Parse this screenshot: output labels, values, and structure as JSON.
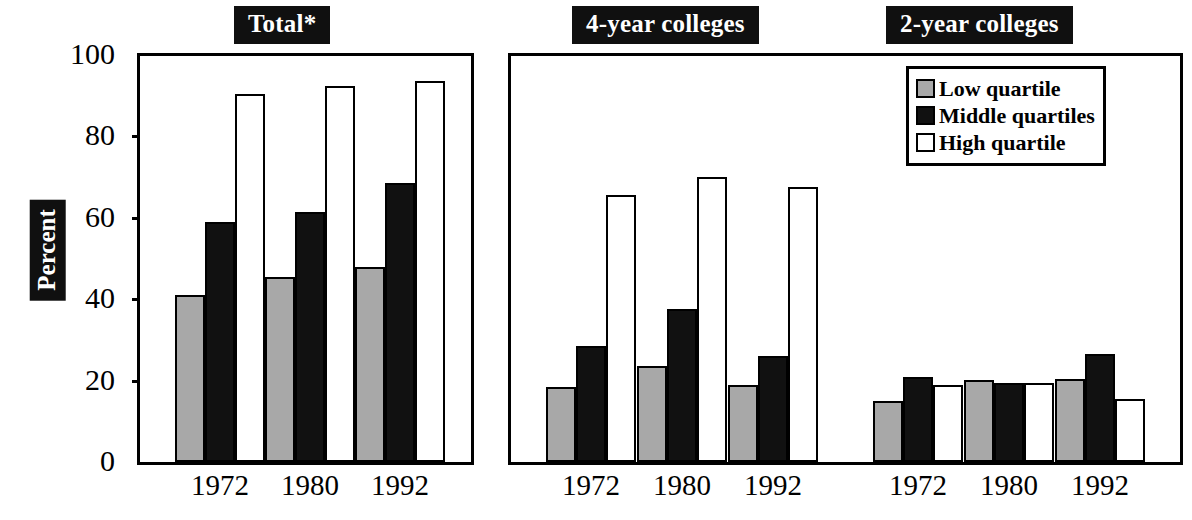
{
  "figure": {
    "ylabel": "Percent",
    "panels": [
      {
        "id": "total",
        "title": "Total*"
      },
      {
        "id": "four_year",
        "title": "4-year colleges"
      },
      {
        "id": "two_year",
        "title": "2-year colleges"
      }
    ]
  },
  "axis": {
    "ticks": [
      {
        "value": 100,
        "label": "100"
      },
      {
        "value": 80,
        "label": "80"
      },
      {
        "value": 60,
        "label": "60"
      },
      {
        "value": 40,
        "label": "40"
      },
      {
        "value": 20,
        "label": "20"
      },
      {
        "value": 0,
        "label": "0"
      }
    ],
    "ymin": 0,
    "ymax": 100
  },
  "legend": {
    "title": "",
    "entries": [
      {
        "label": "Low quartile",
        "color": "#a8a8a8",
        "key": "low"
      },
      {
        "label": "Middle quartiles",
        "color": "#111111",
        "key": "middle"
      },
      {
        "label": "High quartile",
        "color": "#ffffff",
        "key": "high"
      }
    ]
  },
  "xlabels": {
    "total": [
      "1972",
      "1980",
      "1992"
    ],
    "four_year": [
      "1972",
      "1980",
      "1992"
    ],
    "two_year": [
      "1972",
      "1980",
      "1992"
    ]
  },
  "chart_data": {
    "type": "bar",
    "title": "Total*",
    "xlabel": "",
    "ylabel": "Percent",
    "ylim": [
      0,
      100
    ],
    "grid": false,
    "legend_position": "top-right",
    "panel_titles": [
      "Total*",
      "4-year colleges",
      "2-year colleges"
    ],
    "categories": [
      "1972",
      "1980",
      "1992"
    ],
    "series_names": [
      "Low quartile",
      "Middle quartiles",
      "High quartile"
    ],
    "panels": [
      {
        "name": "Total*",
        "categories": [
          "1972",
          "1980",
          "1992"
        ],
        "series": [
          {
            "name": "Low quartile",
            "values": [
              41,
              45.5,
              48
            ]
          },
          {
            "name": "Middle quartiles",
            "values": [
              59,
              61.5,
              68.5
            ]
          },
          {
            "name": "High quartile",
            "values": [
              90.5,
              92.5,
              93.5
            ]
          }
        ]
      },
      {
        "name": "4-year colleges",
        "categories": [
          "1972",
          "1980",
          "1992"
        ],
        "series": [
          {
            "name": "Low quartile",
            "values": [
              18.5,
              23.5,
              19
            ]
          },
          {
            "name": "Middle quartiles",
            "values": [
              28.5,
              37.5,
              26
            ]
          },
          {
            "name": "High quartile",
            "values": [
              65.5,
              70,
              67.5
            ]
          }
        ]
      },
      {
        "name": "2-year colleges",
        "categories": [
          "1972",
          "1980",
          "1992"
        ],
        "series": [
          {
            "name": "Low quartile",
            "values": [
              15,
              20.2,
              20.5
            ]
          },
          {
            "name": "Middle quartiles",
            "values": [
              21,
              19.3,
              26.5
            ]
          },
          {
            "name": "High quartile",
            "values": [
              19,
              19.5,
              15.5
            ]
          }
        ]
      }
    ]
  }
}
